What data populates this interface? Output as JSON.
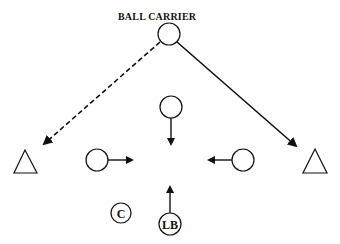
{
  "diagram": {
    "title": "BALL CARRIER",
    "players": [
      {
        "id": "ball-carrier",
        "shape": "circle",
        "x": 169,
        "y": 34,
        "label": ""
      },
      {
        "id": "middle-defender",
        "shape": "circle",
        "x": 171,
        "y": 107,
        "label": ""
      },
      {
        "id": "left-defender",
        "shape": "circle",
        "x": 97,
        "y": 160,
        "label": ""
      },
      {
        "id": "right-defender",
        "shape": "circle",
        "x": 243,
        "y": 160,
        "label": ""
      },
      {
        "id": "left-triangle",
        "shape": "triangle",
        "x": 25,
        "y": 162,
        "label": ""
      },
      {
        "id": "right-triangle",
        "shape": "triangle",
        "x": 315,
        "y": 162,
        "label": ""
      },
      {
        "id": "center",
        "shape": "circle",
        "x": 121,
        "y": 213,
        "label": "C"
      },
      {
        "id": "linebacker",
        "shape": "circle",
        "x": 170,
        "y": 224,
        "label": "LB"
      }
    ],
    "labels": {
      "center": "C",
      "linebacker": "LB"
    },
    "line_color": "#111111"
  }
}
